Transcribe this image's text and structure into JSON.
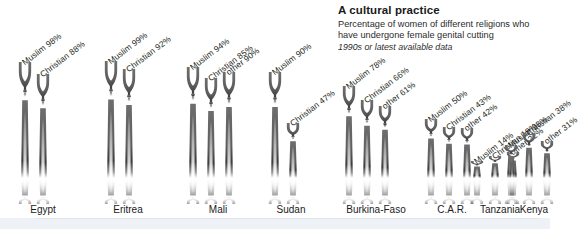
{
  "header": {
    "title": "A cultural practice",
    "subtitle_line1": "Percentage of women of different religions who",
    "subtitle_line2": "have undergone female genital cutting",
    "note": "1990s or latest available data"
  },
  "colors": {
    "figure_dark": "#5a5a5a",
    "figure_mid": "#7d7d7d",
    "text": "#231f20",
    "bottom_band": "#eef2f6",
    "rule": "#dfe5ea"
  },
  "chart_data": {
    "type": "bar",
    "title": "A cultural practice",
    "subtitle": "Percentage of women of different religions who have undergone female genital cutting",
    "annotation": "1990s or latest available data",
    "xlabel": "",
    "ylabel": "Percentage of women",
    "ylim": [
      0,
      100
    ],
    "grid": false,
    "legend_position": "none",
    "unit": "%",
    "categories": [
      "Egypt",
      "Eritrea",
      "Mali",
      "Sudan",
      "Burkina-Faso",
      "C.A.R.",
      "Tanzania",
      "Kenya"
    ],
    "series": [
      {
        "name": "Muslim",
        "values": [
          98,
          99,
          94,
          90,
          78,
          50,
          14,
          28
        ]
      },
      {
        "name": "Christian",
        "values": [
          88,
          92,
          85,
          47,
          66,
          43,
          19,
          38
        ]
      },
      {
        "name": "other",
        "values": [
          null,
          null,
          90,
          null,
          61,
          42,
          22,
          31
        ]
      }
    ],
    "groups": [
      {
        "country": "Egypt",
        "bars": [
          {
            "label": "Muslim 98%",
            "religion": "Muslim",
            "value": 98
          },
          {
            "label": "Christian 88%",
            "religion": "Christian",
            "value": 88
          }
        ]
      },
      {
        "country": "Eritrea",
        "bars": [
          {
            "label": "Muslim 99%",
            "religion": "Muslim",
            "value": 99
          },
          {
            "label": "Christian 92%",
            "religion": "Christian",
            "value": 92
          }
        ]
      },
      {
        "country": "Mali",
        "bars": [
          {
            "label": "Muslim 94%",
            "religion": "Muslim",
            "value": 94
          },
          {
            "label": "Christian 85%",
            "religion": "Christian",
            "value": 85
          },
          {
            "label": "other 90%",
            "religion": "other",
            "value": 90
          }
        ]
      },
      {
        "country": "Sudan",
        "bars": [
          {
            "label": "Muslim 90%",
            "religion": "Muslim",
            "value": 90
          },
          {
            "label": "Christian 47%",
            "religion": "Christian",
            "value": 47
          }
        ]
      },
      {
        "country": "Burkina-Faso",
        "bars": [
          {
            "label": "Muslim 78%",
            "religion": "Muslim",
            "value": 78
          },
          {
            "label": "Christian 66%",
            "religion": "Christian",
            "value": 66
          },
          {
            "label": "other 61%",
            "religion": "other",
            "value": 61
          }
        ]
      },
      {
        "country": "C.A.R.",
        "bars": [
          {
            "label": "Muslim 50%",
            "religion": "Muslim",
            "value": 50
          },
          {
            "label": "Christian 43%",
            "religion": "Christian",
            "value": 43
          },
          {
            "label": "other 42%",
            "religion": "other",
            "value": 42
          }
        ]
      },
      {
        "country": "Tanzania",
        "bars": [
          {
            "label": "Muslim 14%",
            "religion": "Muslim",
            "value": 14
          },
          {
            "label": "Christian 19%",
            "religion": "Christian",
            "value": 19
          },
          {
            "label": "other 22%",
            "religion": "other",
            "value": 22
          }
        ]
      },
      {
        "country": "Kenya",
        "bars": [
          {
            "label": "Muslim 28%",
            "religion": "Muslim",
            "value": 28
          },
          {
            "label": "Christian 38%",
            "religion": "Christian",
            "value": 38
          },
          {
            "label": "other 31%",
            "religion": "other",
            "value": 31
          }
        ]
      }
    ]
  },
  "layout": {
    "group_x": [
      14,
      100,
      186,
      272,
      358,
      444,
      530,
      616
    ],
    "note": "layout handled in template"
  }
}
